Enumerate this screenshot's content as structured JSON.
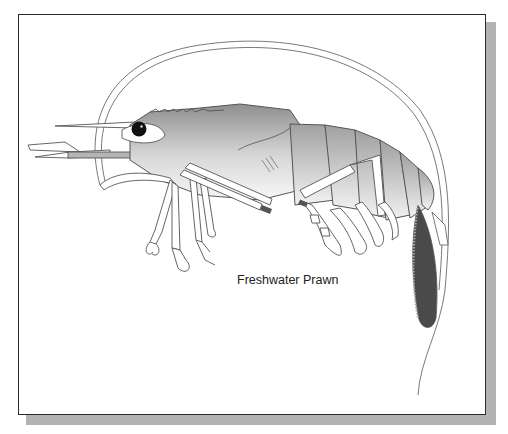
{
  "diagram": {
    "caption": "Freshwater Prawn",
    "parts": [
      "rostrum",
      "eye",
      "antenna",
      "antennules",
      "carapace",
      "abdomen-segments",
      "walking-legs",
      "chelipeds",
      "swimmerets",
      "tail-fan"
    ],
    "colors": {
      "frame_border": "#2a2a2a",
      "shadow": "#b3b3b3",
      "body_dark": "#8f8f8f",
      "body_light": "#f2f2f2",
      "eye": "#111111",
      "tail_dark": "#4a4a4a",
      "outline": "#555555"
    }
  }
}
